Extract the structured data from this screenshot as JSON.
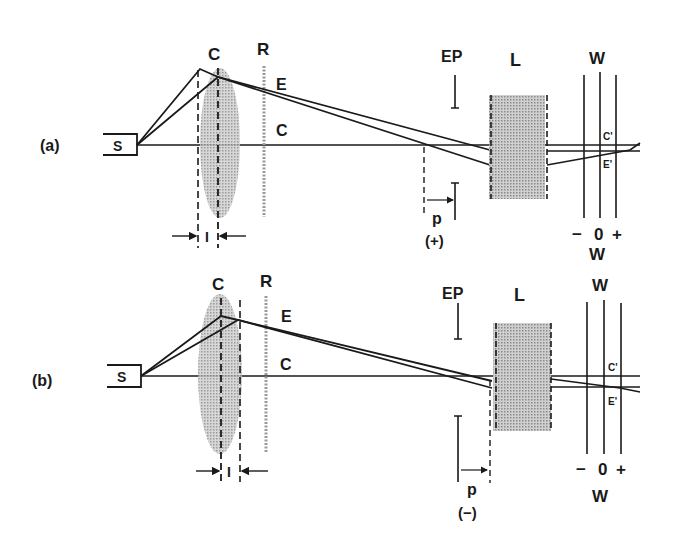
{
  "panels": [
    {
      "id": "a",
      "label": "(a)",
      "source": "S",
      "lens_c": "C",
      "ring_r": "R",
      "ray_e": "E",
      "ray_c": "C",
      "entrance_pupil": "EP",
      "lens_l": "L",
      "screen_top": "W",
      "screen_bottom": "W",
      "scale_minus": "−",
      "scale_zero": "0",
      "scale_plus": "+",
      "image_c": "C'",
      "image_e": "E'",
      "spacing": "I",
      "p_label": "p",
      "p_sign": "(+)"
    },
    {
      "id": "b",
      "label": "(b)",
      "source": "S",
      "lens_c": "C",
      "ring_r": "R",
      "ray_e": "E",
      "ray_c": "C",
      "entrance_pupil": "EP",
      "lens_l": "L",
      "screen_top": "W",
      "screen_bottom": "W",
      "scale_minus": "−",
      "scale_zero": "0",
      "scale_plus": "+",
      "image_c": "C'",
      "image_e": "E'",
      "spacing": "I",
      "p_label": "p",
      "p_sign": "(−)"
    }
  ],
  "colors": {
    "ink": "#1a1a1a",
    "shade": "#b4b4b4"
  }
}
